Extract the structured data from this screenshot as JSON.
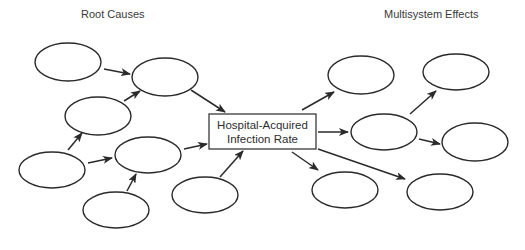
{
  "headers": {
    "left": "Root Causes",
    "right": "Multisystem Effects"
  },
  "center_box": {
    "line1": "Hospital-Acquired",
    "line2": "Infection Rate"
  },
  "colors": {
    "stroke": "#2a2a2a",
    "background": "#ffffff"
  },
  "nodes": {
    "root_causes": [
      {
        "id": "rc1",
        "label": ""
      },
      {
        "id": "rc2",
        "label": ""
      },
      {
        "id": "rc3",
        "label": ""
      },
      {
        "id": "rc4",
        "label": ""
      },
      {
        "id": "rc5",
        "label": ""
      },
      {
        "id": "rc6",
        "label": ""
      },
      {
        "id": "rc7",
        "label": ""
      }
    ],
    "effects": [
      {
        "id": "ef1",
        "label": ""
      },
      {
        "id": "ef2",
        "label": ""
      },
      {
        "id": "ef3",
        "label": ""
      },
      {
        "id": "ef4",
        "label": ""
      },
      {
        "id": "ef5",
        "label": ""
      },
      {
        "id": "ef6",
        "label": ""
      }
    ]
  },
  "edges": [
    [
      "rc1",
      "rc2"
    ],
    [
      "rc3",
      "rc2"
    ],
    [
      "rc2",
      "center"
    ],
    [
      "rc4",
      "rc3"
    ],
    [
      "rc4",
      "rc5"
    ],
    [
      "rc6",
      "rc5"
    ],
    [
      "rc5",
      "center"
    ],
    [
      "rc7",
      "center"
    ],
    [
      "center",
      "ef1"
    ],
    [
      "center",
      "ef3"
    ],
    [
      "center",
      "ef5"
    ],
    [
      "center",
      "ef6"
    ],
    [
      "ef3",
      "ef2"
    ],
    [
      "ef3",
      "ef4"
    ]
  ]
}
